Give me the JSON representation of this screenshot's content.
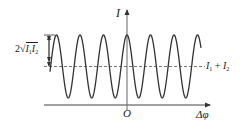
{
  "chart_data": {
    "type": "line",
    "title": "",
    "xlabel": "Δφ",
    "ylabel": "I",
    "origin_label": "O",
    "function": "I = I1 + I2 + 2*sqrt(I1*I2)*cos(Δφ)",
    "mean_level_label": "I₁ + I₂",
    "amplitude_label": "2√(I₁I₂)",
    "periods_visible": 6,
    "peaks_x_px": [
      57,
      80,
      104,
      127,
      151,
      174,
      198
    ],
    "peak_at_origin": true,
    "grid": false,
    "legend": "none",
    "annotations": [
      {
        "text": "2√(I₁I₂)",
        "type": "double-arrow",
        "from": "mean level",
        "to": "peak"
      },
      {
        "text": "I₁ + I₂",
        "type": "dashed-line",
        "position": "mean level"
      }
    ]
  },
  "labels": {
    "y_axis": "I",
    "x_axis": "Δφ",
    "origin": "O",
    "amplitude_prefix": "2",
    "amplitude_I1": "I",
    "amplitude_I1_sub": "1",
    "amplitude_I2": "I",
    "amplitude_I2_sub": "2",
    "mean_I1": "I",
    "mean_I1_sub": "1",
    "mean_plus": "+",
    "mean_I2": "I",
    "mean_I2_sub": "2"
  },
  "colors": {
    "curve": "#333333",
    "axis": "#444444",
    "dashed": "#555555"
  }
}
